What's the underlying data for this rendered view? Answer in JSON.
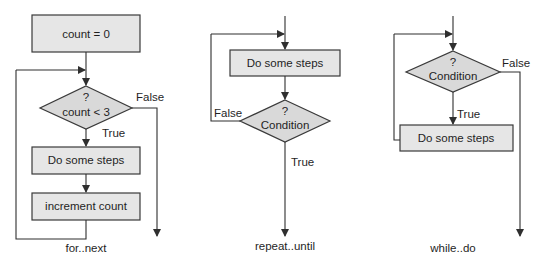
{
  "diagrams": {
    "for_next": {
      "caption": "for..next",
      "init_box": "count = 0",
      "decision_q": "?",
      "decision_text": "count < 3",
      "false_label": "False",
      "true_label": "True",
      "step_box": "Do some steps",
      "increment_box": "increment count"
    },
    "repeat_until": {
      "caption": "repeat..until",
      "step_box": "Do some steps",
      "decision_q": "?",
      "decision_text": "Condition",
      "false_label": "False",
      "true_label": "True"
    },
    "while_do": {
      "caption": "while..do",
      "decision_q": "?",
      "decision_text": "Condition",
      "false_label": "False",
      "true_label": "True",
      "step_box": "Do some steps"
    }
  },
  "colors": {
    "box_fill": "#e6e6e6",
    "diamond_fill": "#d9d9d9",
    "line": "#2f2f2f"
  }
}
